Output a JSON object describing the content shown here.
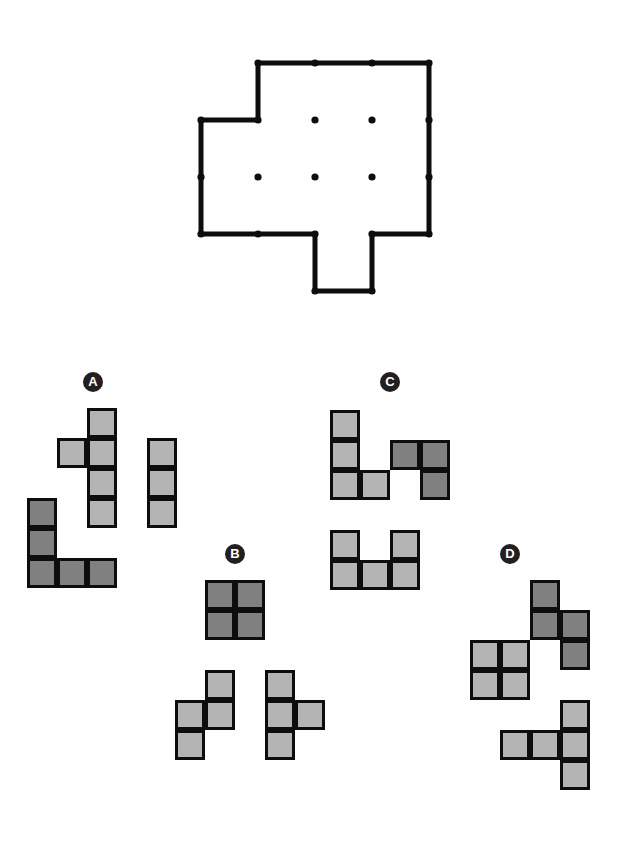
{
  "page": {
    "background_color": "#fefefe"
  },
  "colors": {
    "outline_stroke": "#0d0d0d",
    "vertex_dot": "#0d0d0d",
    "interior_dot": "#0d0d0d",
    "cell_light": "#b4b4b4",
    "cell_dark": "#808080",
    "cell_border": "#0d0d0d",
    "label_badge_bg": "#231f20",
    "label_badge_text": "#ffffff"
  },
  "target_shape": {
    "name": "target-outline",
    "grid_unit_px": 57,
    "origin": {
      "x": 201,
      "y": 63
    },
    "stroke_width": 5,
    "outline_points": [
      [
        1,
        0
      ],
      [
        4,
        0
      ],
      [
        4,
        3
      ],
      [
        4,
        3
      ],
      [
        4,
        3
      ],
      [
        3,
        3
      ],
      [
        3,
        4
      ],
      [
        2,
        4
      ],
      [
        2,
        3
      ],
      [
        0,
        3
      ],
      [
        0,
        1
      ],
      [
        1,
        1
      ]
    ],
    "outline_path_units": "M1,0 L4,0 L4,3 L3,3 L3,4 L2,4 L2,3 L0,3 L0,1 L1,1 Z",
    "vertex_dots_units": [
      [
        1,
        0
      ],
      [
        2,
        0
      ],
      [
        3,
        0
      ],
      [
        4,
        0
      ],
      [
        4,
        1
      ],
      [
        4,
        2
      ],
      [
        4,
        3
      ],
      [
        3,
        3
      ],
      [
        2,
        3
      ],
      [
        1,
        3
      ],
      [
        0,
        3
      ],
      [
        0,
        2
      ],
      [
        0,
        1
      ],
      [
        1,
        1
      ],
      [
        3,
        4
      ],
      [
        2,
        4
      ]
    ],
    "interior_dots_units": [
      [
        2,
        1
      ],
      [
        3,
        1
      ],
      [
        1,
        2
      ],
      [
        2,
        2
      ],
      [
        3,
        2
      ]
    ],
    "area_units": 11
  },
  "options": [
    {
      "id": "A",
      "label": "A",
      "label_pos": {
        "x": 83,
        "y": 372
      },
      "cell_size": 30,
      "origin": {
        "x": 27,
        "y": 408
      },
      "pieces": [
        {
          "name": "piece-a-1",
          "shade": "light",
          "cells": [
            [
              2,
              0
            ],
            [
              1,
              1
            ],
            [
              2,
              1
            ],
            [
              2,
              2
            ],
            [
              2,
              3
            ]
          ]
        },
        {
          "name": "piece-a-2",
          "shade": "light",
          "cells": [
            [
              4,
              1
            ],
            [
              4,
              2
            ],
            [
              4,
              3
            ]
          ]
        },
        {
          "name": "piece-a-3",
          "shade": "dark",
          "cells": [
            [
              0,
              3
            ],
            [
              0,
              4
            ],
            [
              0,
              5
            ],
            [
              1,
              5
            ],
            [
              2,
              5
            ]
          ]
        }
      ]
    },
    {
      "id": "B",
      "label": "B",
      "label_pos": {
        "x": 225,
        "y": 544
      },
      "cell_size": 30,
      "origin": {
        "x": 175,
        "y": 580
      },
      "pieces": [
        {
          "name": "piece-b-1",
          "shade": "dark",
          "cells": [
            [
              1,
              0
            ],
            [
              2,
              0
            ],
            [
              1,
              1
            ],
            [
              2,
              1
            ]
          ]
        },
        {
          "name": "piece-b-2",
          "shade": "light",
          "cells": [
            [
              1,
              3
            ],
            [
              0,
              4
            ],
            [
              1,
              4
            ],
            [
              0,
              5
            ]
          ]
        },
        {
          "name": "piece-b-3",
          "shade": "light",
          "cells": [
            [
              3,
              3
            ],
            [
              3,
              4
            ],
            [
              4,
              4
            ],
            [
              3,
              5
            ]
          ]
        }
      ]
    },
    {
      "id": "C",
      "label": "C",
      "label_pos": {
        "x": 380,
        "y": 372
      },
      "cell_size": 30,
      "origin": {
        "x": 330,
        "y": 410
      },
      "pieces": [
        {
          "name": "piece-c-1",
          "shade": "light",
          "cells": [
            [
              0,
              0
            ],
            [
              0,
              1
            ],
            [
              0,
              2
            ],
            [
              1,
              2
            ]
          ]
        },
        {
          "name": "piece-c-2",
          "shade": "dark",
          "cells": [
            [
              2,
              1
            ],
            [
              3,
              1
            ],
            [
              3,
              2
            ]
          ]
        },
        {
          "name": "piece-c-3",
          "shade": "light",
          "cells": [
            [
              0,
              4
            ],
            [
              2,
              4
            ],
            [
              0,
              5
            ],
            [
              1,
              5
            ],
            [
              2,
              5
            ]
          ]
        }
      ]
    },
    {
      "id": "D",
      "label": "D",
      "label_pos": {
        "x": 500,
        "y": 544
      },
      "cell_size": 30,
      "origin": {
        "x": 470,
        "y": 580
      },
      "pieces": [
        {
          "name": "piece-d-1",
          "shade": "dark",
          "cells": [
            [
              2,
              0
            ],
            [
              2,
              1
            ],
            [
              3,
              1
            ],
            [
              3,
              2
            ]
          ]
        },
        {
          "name": "piece-d-2",
          "shade": "light",
          "cells": [
            [
              0,
              2
            ],
            [
              1,
              2
            ],
            [
              0,
              3
            ],
            [
              1,
              3
            ]
          ]
        },
        {
          "name": "piece-d-3",
          "shade": "light",
          "cells": [
            [
              3,
              4
            ],
            [
              1,
              5
            ],
            [
              2,
              5
            ],
            [
              3,
              5
            ],
            [
              3,
              6
            ]
          ]
        }
      ]
    }
  ]
}
